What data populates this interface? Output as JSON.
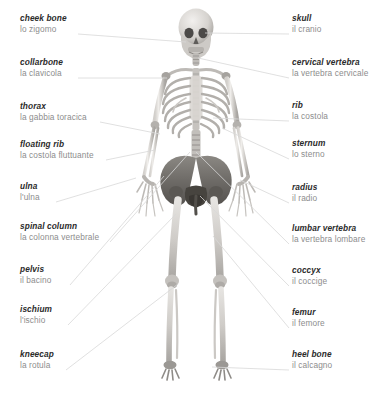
{
  "figure": {
    "background_color": "#ffffff",
    "leader_line_color": "#d8d8d8",
    "english_text_color": "#2b2b2b",
    "italian_text_color": "#8d8d8d",
    "bone_light_color": "#e9e7e4",
    "bone_mid_color": "#b9b6b2",
    "bone_dark_color": "#6f6d6b"
  },
  "labels_left": [
    {
      "en": "cheek bone",
      "it": "lo zigomo",
      "x": 20,
      "y": 14,
      "line": {
        "x1": 78,
        "y1": 34,
        "x2": 186,
        "y2": 42
      }
    },
    {
      "en": "collarbone",
      "it": "la clavicola",
      "x": 20,
      "y": 58,
      "line": {
        "x1": 78,
        "y1": 78,
        "x2": 167,
        "y2": 78
      }
    },
    {
      "en": "thorax",
      "it": "la gabbia toracica",
      "x": 20,
      "y": 102,
      "line": {
        "x1": 100,
        "y1": 122,
        "x2": 160,
        "y2": 134
      }
    },
    {
      "en": "floating rib",
      "it": "la costola fluttuante",
      "x": 20,
      "y": 140,
      "line": {
        "x1": 106,
        "y1": 160,
        "x2": 155,
        "y2": 150
      }
    },
    {
      "en": "ulna",
      "it": "l'ulna",
      "x": 20,
      "y": 182,
      "line": {
        "x1": 56,
        "y1": 202,
        "x2": 136,
        "y2": 178
      }
    },
    {
      "en": "spinal column",
      "it": "la colonna vertebrale",
      "x": 20,
      "y": 222,
      "line": {
        "x1": 110,
        "y1": 242,
        "x2": 190,
        "y2": 152
      }
    },
    {
      "en": "pelvis",
      "it": "il bacino",
      "x": 20,
      "y": 265,
      "line": {
        "x1": 70,
        "y1": 285,
        "x2": 164,
        "y2": 176
      }
    },
    {
      "en": "ischium",
      "it": "l'ischio",
      "x": 20,
      "y": 305,
      "line": {
        "x1": 68,
        "y1": 325,
        "x2": 176,
        "y2": 214
      }
    },
    {
      "en": "kneecap",
      "it": "la rotula",
      "x": 20,
      "y": 350,
      "line": {
        "x1": 66,
        "y1": 370,
        "x2": 178,
        "y2": 284
      }
    }
  ],
  "labels_right": [
    {
      "en": "skull",
      "it": "il cranio",
      "x": 292,
      "y": 14,
      "line": {
        "x1": 289,
        "y1": 34,
        "x2": 205,
        "y2": 33
      }
    },
    {
      "en": "cervical vertebra",
      "it": "la vertebra cervicale",
      "x": 292,
      "y": 58,
      "line": {
        "x1": 289,
        "y1": 78,
        "x2": 198,
        "y2": 58
      }
    },
    {
      "en": "rib",
      "it": "la costola",
      "x": 292,
      "y": 101,
      "line": {
        "x1": 289,
        "y1": 121,
        "x2": 213,
        "y2": 118
      }
    },
    {
      "en": "sternum",
      "it": "lo sterno",
      "x": 292,
      "y": 139,
      "line": {
        "x1": 289,
        "y1": 159,
        "x2": 222,
        "y2": 128
      }
    },
    {
      "en": "radius",
      "it": "il radio",
      "x": 292,
      "y": 183,
      "line": {
        "x1": 289,
        "y1": 203,
        "x2": 240,
        "y2": 180
      }
    },
    {
      "en": "lumbar vertebra",
      "it": "la vertebra lombare",
      "x": 292,
      "y": 224,
      "line": {
        "x1": 289,
        "y1": 244,
        "x2": 196,
        "y2": 152
      }
    },
    {
      "en": "coccyx",
      "it": "il coccige",
      "x": 292,
      "y": 266,
      "line": {
        "x1": 289,
        "y1": 286,
        "x2": 200,
        "y2": 196
      }
    },
    {
      "en": "femur",
      "it": "il femore",
      "x": 292,
      "y": 308,
      "line": {
        "x1": 289,
        "y1": 328,
        "x2": 213,
        "y2": 236
      }
    },
    {
      "en": "heel bone",
      "it": "il calcagno",
      "x": 292,
      "y": 350,
      "line": {
        "x1": 289,
        "y1": 370,
        "x2": 212,
        "y2": 367
      }
    }
  ]
}
